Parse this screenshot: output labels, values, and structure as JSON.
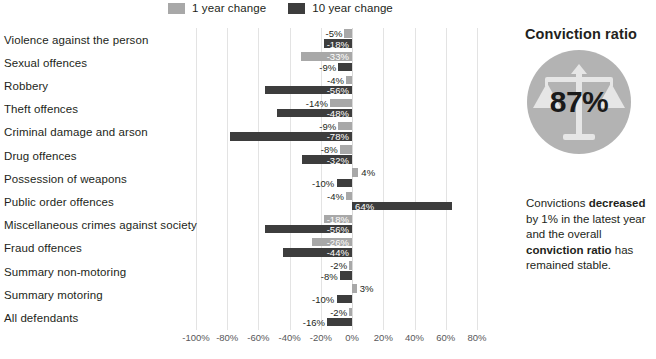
{
  "legend": {
    "items": [
      {
        "label": "1 year change",
        "color": "#a8a8a8",
        "icon": "legend-swatch"
      },
      {
        "label": "10 year change",
        "color": "#3d3d3d",
        "icon": "legend-swatch"
      }
    ]
  },
  "panel": {
    "title": "Conviction ratio",
    "dial_value": "87%",
    "dial_color": "#b3b3b3",
    "icon": "scales-of-justice-icon",
    "text_parts": [
      {
        "text": "Convictions ",
        "bold": false
      },
      {
        "text": "decreased",
        "bold": true
      },
      {
        "text": " by 1% in the latest year and the overall ",
        "bold": false
      },
      {
        "text": "conviction ratio",
        "bold": true
      },
      {
        "text": " has remained stable.",
        "bold": false
      }
    ],
    "text_plain": "Convictions decreased by 1% in the latest year and the overall conviction ratio has remained stable."
  },
  "chart_data": {
    "type": "bar",
    "orientation": "horizontal",
    "title": "",
    "xlabel": "",
    "ylabel": "",
    "xlim": [
      -100,
      80
    ],
    "xticks": [
      -100,
      -80,
      -60,
      -40,
      -20,
      0,
      20,
      40,
      60,
      80
    ],
    "xtick_labels": [
      "-100%",
      "-80%",
      "-60%",
      "-40%",
      "-20%",
      "0%",
      "20%",
      "40%",
      "60%",
      "80%"
    ],
    "grid": true,
    "legend_position": "top",
    "categories": [
      "Violence against the person",
      "Sexual offences",
      "Robbery",
      "Theft offences",
      "Criminal damage and arson",
      "Drug offences",
      "Possession of weapons",
      "Public order offences",
      "Miscellaneous crimes against society",
      "Fraud offences",
      "Summary non-motoring",
      "Summary motoring",
      "All defendants"
    ],
    "series": [
      {
        "name": "1 year change",
        "color": "#a8a8a8",
        "values": [
          -5,
          -33,
          -4,
          -14,
          -9,
          -8,
          4,
          -4,
          -18,
          -26,
          -2,
          3,
          -2
        ],
        "labels": [
          "-5%",
          "-33%",
          "-4%",
          "-14%",
          "-9%",
          "-8%",
          "4%",
          "-4%",
          "-18%",
          "-26%",
          "-2%",
          "3%",
          "-2%"
        ]
      },
      {
        "name": "10 year change",
        "color": "#3d3d3d",
        "values": [
          -18,
          -9,
          -56,
          -48,
          -78,
          -32,
          -10,
          64,
          -56,
          -44,
          -8,
          -10,
          -16
        ],
        "labels": [
          "-18%",
          "-9%",
          "-56%",
          "-48%",
          "-78%",
          "-32%",
          "-10%",
          "64%",
          "-56%",
          "-44%",
          "-8%",
          "-10%",
          "-16%"
        ]
      }
    ]
  }
}
